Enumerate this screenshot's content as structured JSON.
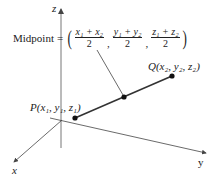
{
  "diagram": {
    "axes": {
      "z_label": "z",
      "x_label": "x",
      "y_label": "y"
    },
    "midpoint_label": {
      "prefix": "Midpoint",
      "equals": "=",
      "fractions": [
        {
          "numerator": "x₁ + x₂",
          "denominator": "2"
        },
        {
          "numerator": "y₁ + y₂",
          "denominator": "2"
        },
        {
          "numerator": "z₁ + z₂",
          "denominator": "2"
        }
      ]
    },
    "points": {
      "P": {
        "label": "P(x₁, y₁, z₁)"
      },
      "Q": {
        "label": "Q(x₂, y₂, z₂)"
      },
      "M": {
        "label": "midpoint"
      }
    },
    "colors": {
      "axis": "#555555",
      "segment": "#333333",
      "point": "#111111"
    }
  }
}
